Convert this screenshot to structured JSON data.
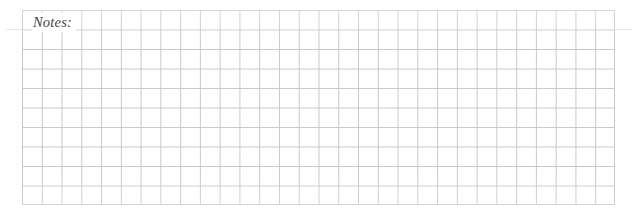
{
  "page": {
    "background_color": "#ffffff",
    "width": 633,
    "height": 217
  },
  "notes_section": {
    "label": "Notes:",
    "label_color": "#45454a",
    "grid": {
      "columns": 30,
      "rows": 10,
      "cell_width": 19.7667,
      "cell_height": 19.5,
      "line_color": "#c5c9cd",
      "line_width": 1,
      "left": 22,
      "top": 10,
      "width": 593,
      "height": 195,
      "fill_color": "#ffffff"
    },
    "bleed_rule_color": "#dfe2e5"
  }
}
